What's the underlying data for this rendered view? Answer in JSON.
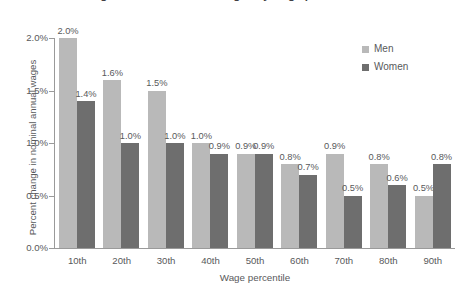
{
  "title": {
    "text": "Percent change in nominal annual wages by wage percentile",
    "visible_note": "cropped at top edge"
  },
  "legend": {
    "position": "top-right",
    "items": [
      {
        "label": "Men",
        "color": "#b9b9b9",
        "swatch_name": "legend-swatch-men"
      },
      {
        "label": "Women",
        "color": "#6e6e6e",
        "swatch_name": "legend-swatch-women"
      }
    ]
  },
  "axes": {
    "y_title": "Percent change in nominal annual wages",
    "x_title": "Wage percentile",
    "y_ticks": [
      "0.0%",
      "0.5%",
      "1.0%",
      "1.5%",
      "2.0%"
    ]
  },
  "chart_data": {
    "type": "bar",
    "title": "Percent change in nominal annual wages by wage percentile",
    "xlabel": "Wage percentile",
    "ylabel": "Percent change in nominal annual wages",
    "ylim": [
      0,
      2.0
    ],
    "ytick_values": [
      0.0,
      0.5,
      1.0,
      1.5,
      2.0
    ],
    "ytick_labels": [
      "0.0%",
      "0.5%",
      "1.0%",
      "1.5%",
      "2.0%"
    ],
    "grid": false,
    "legend_position": "top-right",
    "categories": [
      "10th",
      "20th",
      "30th",
      "40th",
      "50th",
      "60th",
      "70th",
      "80th",
      "90th"
    ],
    "series": [
      {
        "name": "Men",
        "color": "#b9b9b9",
        "values": [
          2.0,
          1.6,
          1.5,
          1.0,
          0.9,
          0.8,
          0.9,
          0.8,
          0.5
        ],
        "labels": [
          "2.0%",
          "1.6%",
          "1.5%",
          "1.0%",
          "0.9%",
          "0.8%",
          "0.9%",
          "0.8%",
          "0.5%"
        ]
      },
      {
        "name": "Women",
        "color": "#6e6e6e",
        "values": [
          1.4,
          1.0,
          1.0,
          0.9,
          0.9,
          0.7,
          0.5,
          0.6,
          0.8
        ],
        "labels": [
          "1.4%",
          "1.0%",
          "1.0%",
          "0.9%",
          "0.9%",
          "0.7%",
          "0.5%",
          "0.6%",
          "0.8%"
        ]
      }
    ]
  }
}
